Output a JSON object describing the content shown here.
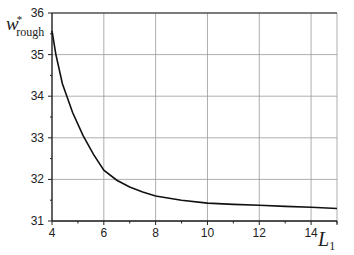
{
  "chart_data": {
    "type": "line",
    "title": "",
    "xlabel": "L",
    "xlabel_sub": "1",
    "ylabel": "w",
    "ylabel_sup": "*",
    "ylabel_sub": "rough",
    "xlim": [
      4,
      15
    ],
    "ylim": [
      31,
      36
    ],
    "xticks": [
      4,
      6,
      8,
      10,
      12,
      14
    ],
    "yticks": [
      31,
      32,
      33,
      34,
      35,
      36
    ],
    "grid": true,
    "series": [
      {
        "name": "w*rough",
        "x": [
          4,
          4.15,
          4.4,
          4.8,
          5.2,
          5.6,
          6,
          6.5,
          7,
          7.5,
          8,
          9,
          10,
          11,
          12,
          13,
          14,
          15
        ],
        "y": [
          35.57,
          35.0,
          34.3,
          33.6,
          33.05,
          32.6,
          32.22,
          31.98,
          31.82,
          31.7,
          31.6,
          31.5,
          31.43,
          31.4,
          31.38,
          31.35,
          31.33,
          31.3
        ]
      }
    ]
  }
}
